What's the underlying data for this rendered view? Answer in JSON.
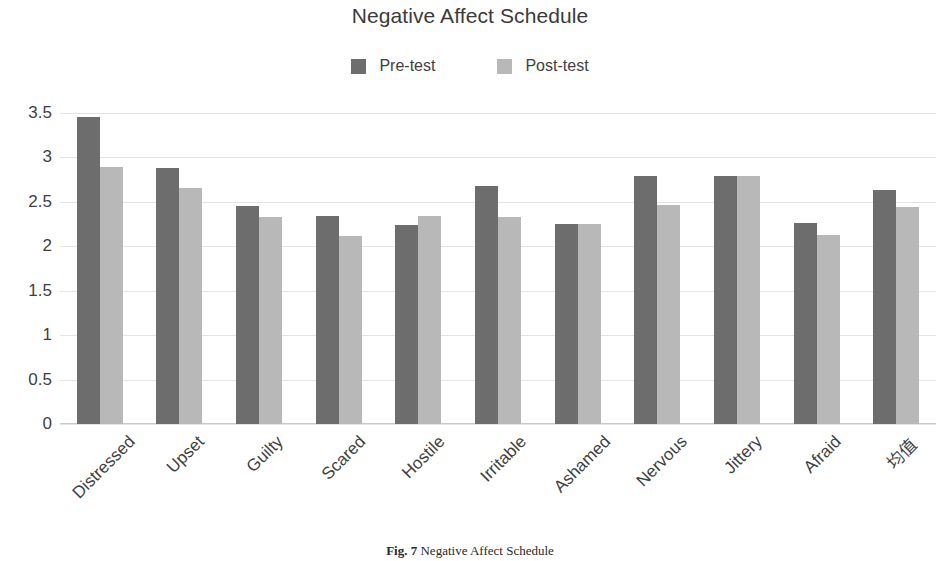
{
  "chart_data": {
    "type": "bar",
    "title": "Negative Affect Schedule",
    "xlabel": "",
    "ylabel": "",
    "ylim": [
      0,
      3.5
    ],
    "yticks": [
      "0",
      "0.5",
      "1",
      "1.5",
      "2",
      "2.5",
      "3",
      "3.5"
    ],
    "ytick_values": [
      0,
      0.5,
      1,
      1.5,
      2,
      2.5,
      3,
      3.5
    ],
    "grid": true,
    "legend_position": "top-center",
    "categories": [
      "Distressed",
      "Upset",
      "Guilty",
      "Scared",
      "Hostile",
      "Irritable",
      "Ashamed",
      "Nervous",
      "Jittery",
      "Afraid",
      "均值"
    ],
    "series": [
      {
        "name": "Pre-test",
        "color": "#6d6d6d",
        "values": [
          3.45,
          2.88,
          2.45,
          2.34,
          2.24,
          2.68,
          2.25,
          2.79,
          2.79,
          2.26,
          2.63
        ]
      },
      {
        "name": "Post-test",
        "color": "#b8b8b8",
        "values": [
          2.89,
          2.66,
          2.33,
          2.12,
          2.34,
          2.33,
          2.25,
          2.46,
          2.79,
          2.13,
          2.44
        ]
      }
    ]
  },
  "legend": {
    "items": [
      {
        "label": "Pre-test",
        "color": "#6d6d6d"
      },
      {
        "label": "Post-test",
        "color": "#b8b8b8"
      }
    ]
  },
  "caption": {
    "number": "Fig. 7",
    "text": "Negative Affect Schedule"
  }
}
